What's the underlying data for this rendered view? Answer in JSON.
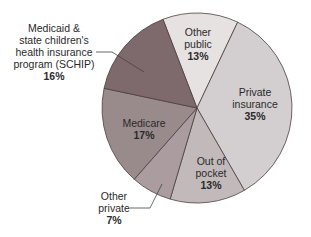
{
  "chart_data": {
    "type": "pie",
    "title": "",
    "start_angle_deg": -21,
    "slices": [
      {
        "label": "Other public",
        "value": 13,
        "pct_text": "13%",
        "color": "#e6e2e2"
      },
      {
        "label": "Private insurance",
        "value": 35,
        "pct_text": "35%",
        "color": "#d3cfd0"
      },
      {
        "label": "Out of pocket",
        "value": 13,
        "pct_text": "13%",
        "color": "#c2b9bb"
      },
      {
        "label": "Other private",
        "value": 7,
        "pct_text": "7%",
        "color": "#ab9d9f"
      },
      {
        "label": "Medicare",
        "value": 17,
        "pct_text": "17%",
        "color": "#998a8c"
      },
      {
        "label": "Medicaid & state children's health insurance program (SCHIP)",
        "value": 16,
        "pct_text": "16%",
        "color": "#7e6a6d"
      }
    ]
  },
  "labels": {
    "other_public": {
      "lines": [
        "Other",
        "public"
      ],
      "pct": "13%"
    },
    "private_insurance": {
      "lines": [
        "Private",
        "insurance"
      ],
      "pct": "35%"
    },
    "out_of_pocket": {
      "lines": [
        "Out of",
        "pocket"
      ],
      "pct": "13%"
    },
    "other_private": {
      "lines": [
        "Other",
        "private"
      ],
      "pct": "7%"
    },
    "medicare": {
      "lines": [
        "Medicare"
      ],
      "pct": "17%"
    },
    "medicaid": {
      "lines": [
        "Medicaid &",
        "state children's",
        "health insurance",
        "program (SCHIP)"
      ],
      "pct": "16%"
    }
  }
}
